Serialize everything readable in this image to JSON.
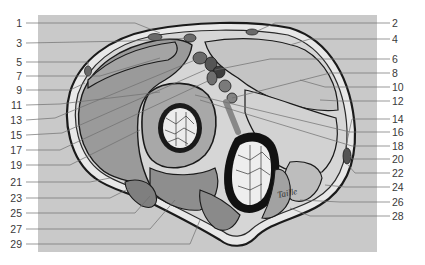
{
  "figure": {
    "type": "anatomical cross-section",
    "colors": {
      "background": "#ffffff",
      "panel": "#c9c9c9",
      "muscle": "#9a9a9a",
      "muscle_light": "#b5b5b5",
      "organ_light": "#d8d8d8",
      "fat": "#e8e8e8",
      "vessel_dark": "#555555",
      "outline": "#1a1a1a",
      "leader": "#6f6f6f",
      "label_text": "#3a3a3a"
    },
    "signature": "Taille",
    "labels_left": [
      {
        "num": "1",
        "y": 23
      },
      {
        "num": "3",
        "y": 43
      },
      {
        "num": "5",
        "y": 62
      },
      {
        "num": "7",
        "y": 76
      },
      {
        "num": "9",
        "y": 90
      },
      {
        "num": "11",
        "y": 105
      },
      {
        "num": "13",
        "y": 120
      },
      {
        "num": "15",
        "y": 135
      },
      {
        "num": "17",
        "y": 150
      },
      {
        "num": "19",
        "y": 165
      },
      {
        "num": "21",
        "y": 182
      },
      {
        "num": "23",
        "y": 198
      },
      {
        "num": "25",
        "y": 213
      },
      {
        "num": "27",
        "y": 229
      },
      {
        "num": "29",
        "y": 244
      }
    ],
    "labels_right": [
      {
        "num": "2",
        "y": 23
      },
      {
        "num": "4",
        "y": 39
      },
      {
        "num": "6",
        "y": 59
      },
      {
        "num": "8",
        "y": 73
      },
      {
        "num": "10",
        "y": 87
      },
      {
        "num": "12",
        "y": 101
      },
      {
        "num": "14",
        "y": 119
      },
      {
        "num": "16",
        "y": 132
      },
      {
        "num": "18",
        "y": 146
      },
      {
        "num": "20",
        "y": 159
      },
      {
        "num": "22",
        "y": 173
      },
      {
        "num": "24",
        "y": 187
      },
      {
        "num": "26",
        "y": 202
      },
      {
        "num": "28",
        "y": 216
      }
    ]
  }
}
